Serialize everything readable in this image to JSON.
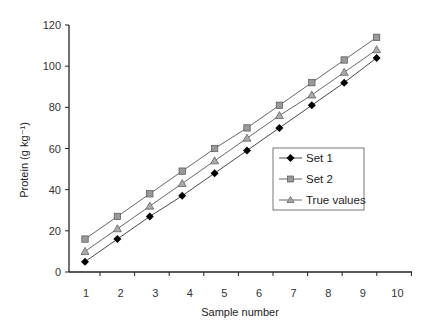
{
  "chart_data": {
    "type": "line",
    "title": "",
    "xlabel": "Sample number",
    "ylabel": "Protein (g kg⁻¹)",
    "x": [
      1,
      2,
      3,
      4,
      5,
      6,
      7,
      8,
      9,
      10
    ],
    "x_tick_labels": [
      "1",
      "2",
      "3",
      "4",
      "5",
      "6",
      "7",
      "8",
      "9",
      "10"
    ],
    "y_ticks": [
      0,
      20,
      40,
      60,
      80,
      100,
      120
    ],
    "ylim": [
      0,
      120
    ],
    "grid": false,
    "legend_position": "inside-right",
    "series": [
      {
        "name": "Set 1",
        "marker": "diamond",
        "color": "#000000",
        "values": [
          5,
          16,
          27,
          37,
          48,
          59,
          70,
          81,
          92,
          104
        ]
      },
      {
        "name": "Set 2",
        "marker": "square",
        "color": "#888888",
        "values": [
          16,
          27,
          38,
          49,
          60,
          70,
          81,
          92,
          103,
          114
        ]
      },
      {
        "name": "True values",
        "marker": "triangle",
        "color": "#888888",
        "values": [
          10,
          21,
          32,
          43,
          54,
          65,
          76,
          86,
          97,
          108
        ]
      }
    ]
  },
  "legend": {
    "items": [
      {
        "label": "Set 1"
      },
      {
        "label": "Set 2"
      },
      {
        "label": "True values"
      }
    ]
  },
  "axes": {
    "xlabel": "Sample number",
    "ylabel": "Protein (g kg⁻¹)"
  }
}
